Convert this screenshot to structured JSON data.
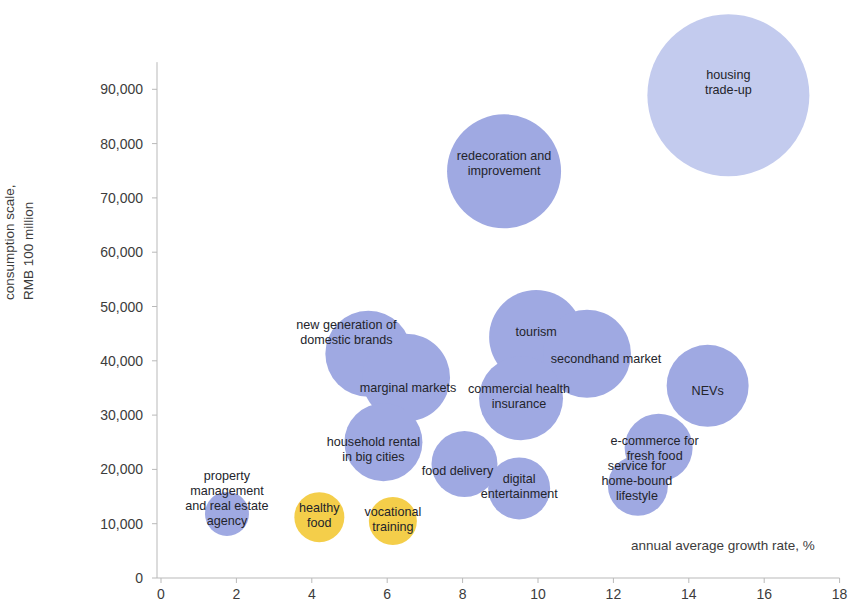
{
  "chart_data": {
    "type": "scatter",
    "title": "",
    "subtitle": "",
    "xlabel": "annual average growth rate, %",
    "ylabel": "consumption scale,\nRMB 100 million",
    "ylabel_line1": "consumption scale,",
    "ylabel_line2": "RMB 100 million",
    "xlim": [
      0,
      18
    ],
    "ylim": [
      0,
      95000
    ],
    "x_ticks": [
      0,
      2,
      4,
      6,
      8,
      10,
      12,
      14,
      16,
      18
    ],
    "x_tick_labels": [
      "0",
      "2",
      "4",
      "6",
      "8",
      "10",
      "12",
      "14",
      "16",
      "18"
    ],
    "y_ticks": [
      0,
      10000,
      20000,
      30000,
      40000,
      50000,
      60000,
      70000,
      80000,
      90000
    ],
    "y_tick_labels": [
      "0",
      "10,000",
      "20,000",
      "30,000",
      "40,000",
      "50,000",
      "60,000",
      "70,000",
      "80,000",
      "90,000"
    ],
    "grid": false,
    "legend": "none",
    "colors": {
      "bubble_blue_light": "#c3cbee",
      "bubble_blue": "#9fa9e2",
      "bubble_yellow": "#f4ce4a",
      "axis": "#b9b9b9",
      "text": "#3c3c3c",
      "label_text": "#23242b"
    },
    "size_note": "bubble area encodes consumption scale magnitude",
    "points": [
      {
        "label": "housing trade-up",
        "label_lines": [
          "housing",
          "trade-up"
        ],
        "x": 15.05,
        "y": 88900,
        "r_px": 81,
        "color": "#c3cbee",
        "label_dx": 0,
        "label_dy": -13
      },
      {
        "label": "redecoration and improvement",
        "label_lines": [
          "redecoration and",
          "improvement"
        ],
        "x": 9.1,
        "y": 74900,
        "r_px": 57,
        "color": "#9fa9e2",
        "label_dx": 0,
        "label_dy": -8
      },
      {
        "label": "tourism",
        "label_lines": [
          "tourism"
        ],
        "x": 9.95,
        "y": 44400,
        "r_px": 47,
        "color": "#9fa9e2",
        "label_dx": 0,
        "label_dy": -5
      },
      {
        "label": "secondhand market",
        "label_lines": [
          "secondhand market"
        ],
        "x": 11.3,
        "y": 41300,
        "r_px": 44,
        "color": "#9fa9e2",
        "label_dx": 19,
        "label_dy": 5
      },
      {
        "label": "new generation of domestic brands",
        "label_lines": [
          "new generation of",
          "domestic brands"
        ],
        "x": 5.5,
        "y": 41300,
        "r_px": 43,
        "color": "#9fa9e2",
        "label_dx": -22,
        "label_dy": -22
      },
      {
        "label": "marginal markets",
        "label_lines": [
          "marginal markets"
        ],
        "x": 6.5,
        "y": 36900,
        "r_px": 44,
        "color": "#9fa9e2",
        "label_dx": 2,
        "label_dy": 10
      },
      {
        "label": "commercial health insurance",
        "label_lines": [
          "commercial health",
          "insurance"
        ],
        "x": 9.55,
        "y": 33100,
        "r_px": 42,
        "color": "#9fa9e2",
        "label_dx": -2,
        "label_dy": -2
      },
      {
        "label": "NEVs",
        "label_lines": [
          "NEVs"
        ],
        "x": 14.5,
        "y": 35400,
        "r_px": 41,
        "color": "#9fa9e2",
        "label_dx": 0,
        "label_dy": 5
      },
      {
        "label": "household rental in big cities",
        "label_lines": [
          "household rental",
          "in big cities"
        ],
        "x": 5.9,
        "y": 25000,
        "r_px": 39,
        "color": "#9fa9e2",
        "label_dx": -10,
        "label_dy": 7
      },
      {
        "label": "e-commerce for fresh food",
        "label_lines": [
          "e-commerce for",
          "fresh food"
        ],
        "x": 13.2,
        "y": 24000,
        "r_px": 34,
        "color": "#9fa9e2",
        "label_dx": -4,
        "label_dy": 0
      },
      {
        "label": "food delivery",
        "label_lines": [
          "food delivery"
        ],
        "x": 8.05,
        "y": 21000,
        "r_px": 33,
        "color": "#9fa9e2",
        "label_dx": -7,
        "label_dy": 7
      },
      {
        "label": "digital entertainment",
        "label_lines": [
          "digital",
          "entertainment"
        ],
        "x": 9.5,
        "y": 16500,
        "r_px": 31,
        "color": "#9fa9e2",
        "label_dx": 0,
        "label_dy": -2
      },
      {
        "label": "service for home-bound lifestyle",
        "label_lines": [
          "service for",
          "home-bound",
          "lifestyle"
        ],
        "x": 12.65,
        "y": 17000,
        "r_px": 30,
        "color": "#9fa9e2",
        "label_dx": -1,
        "label_dy": -5
      },
      {
        "label": "property management and real estate agency",
        "label_lines": [
          "property",
          "management",
          "and real estate",
          "agency"
        ],
        "x": 1.75,
        "y": 11800,
        "r_px": 22,
        "color": "#9fa9e2",
        "label_dx": 0,
        "label_dy": -16
      },
      {
        "label": "healthy food",
        "label_lines": [
          "healthy",
          "food"
        ],
        "x": 4.2,
        "y": 11200,
        "r_px": 25,
        "color": "#f4ce4a",
        "label_dx": 0,
        "label_dy": -2
      },
      {
        "label": "vocational training",
        "label_lines": [
          "vocational",
          "training"
        ],
        "x": 6.15,
        "y": 10500,
        "r_px": 24,
        "color": "#f4ce4a",
        "label_dx": 0,
        "label_dy": -2
      }
    ]
  }
}
